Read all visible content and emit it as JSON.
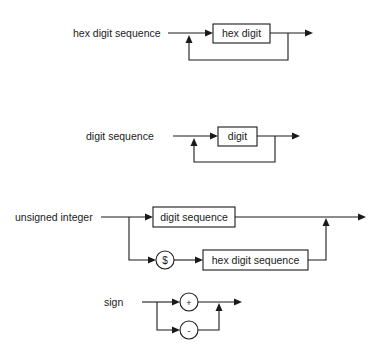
{
  "diagrams": [
    {
      "name": "hex digit sequence",
      "label": "hex digit sequence",
      "elements": [
        {
          "type": "nonterminal",
          "text": "hex digit"
        }
      ],
      "structure": "repeat one or more"
    },
    {
      "name": "digit sequence",
      "label": "digit sequence",
      "elements": [
        {
          "type": "nonterminal",
          "text": "digit"
        }
      ],
      "structure": "repeat one or more"
    },
    {
      "name": "unsigned integer",
      "label": "unsigned integer",
      "elements": [
        {
          "type": "nonterminal",
          "text": "digit sequence"
        },
        {
          "type": "terminal",
          "text": "$"
        },
        {
          "type": "nonterminal",
          "text": "hex digit sequence"
        }
      ],
      "structure": "choice: digit sequence | $ hex digit sequence"
    },
    {
      "name": "sign",
      "label": "sign",
      "elements": [
        {
          "type": "terminal",
          "text": "+"
        },
        {
          "type": "terminal",
          "text": "-"
        }
      ],
      "structure": "choice: + | -"
    }
  ],
  "colors": {
    "ink": "#1a1a1a",
    "background": "#ffffff"
  }
}
